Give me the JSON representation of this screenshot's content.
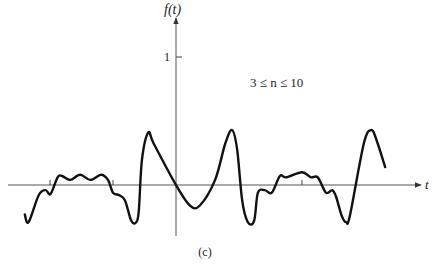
{
  "chart_data": {
    "type": "line",
    "title": "",
    "ylabel": "f(t)",
    "xlabel": "t",
    "yticks": [
      {
        "value": 1,
        "label": "1"
      }
    ],
    "xticks": [
      -2,
      -1,
      2
    ],
    "annotation": "3 ≤ n ≤ 10",
    "caption": "(c)",
    "grid": false,
    "xlim": [
      -2.45,
      3.8
    ],
    "ylim": [
      -0.4,
      1.0
    ],
    "series": [
      {
        "name": "Fourier partial sum (3 ≤ n ≤ 10)",
        "x": [
          -2.4,
          -2.34,
          -2.18,
          -2.07,
          -1.99,
          -1.88,
          -1.81,
          -1.68,
          -1.52,
          -1.36,
          -1.19,
          -1.08,
          -1.0,
          -0.9,
          -0.81,
          -0.71,
          -0.63,
          -0.59,
          -0.54,
          -0.44,
          -0.35,
          0.0,
          0.22,
          0.38,
          0.62,
          0.78,
          0.89,
          0.97,
          1.05,
          1.14,
          1.24,
          1.3,
          1.41,
          1.52,
          1.65,
          1.75,
          2.0,
          2.14,
          2.25,
          2.38,
          2.48,
          2.54,
          2.63,
          2.7,
          2.76,
          2.98,
          3.1,
          3.19,
          3.32
        ],
        "y": [
          -0.23,
          -0.29,
          -0.08,
          -0.04,
          -0.07,
          0.06,
          0.07,
          0.04,
          0.08,
          0.04,
          0.08,
          0.04,
          -0.06,
          -0.08,
          -0.12,
          -0.28,
          -0.29,
          -0.2,
          0.2,
          0.41,
          0.32,
          0.0,
          -0.16,
          -0.16,
          0.04,
          0.32,
          0.43,
          0.28,
          -0.12,
          -0.29,
          -0.28,
          -0.06,
          -0.04,
          -0.06,
          0.07,
          0.06,
          0.1,
          0.06,
          0.06,
          -0.06,
          -0.04,
          -0.09,
          -0.24,
          -0.29,
          -0.24,
          0.32,
          0.43,
          0.34,
          0.14
        ]
      }
    ]
  }
}
